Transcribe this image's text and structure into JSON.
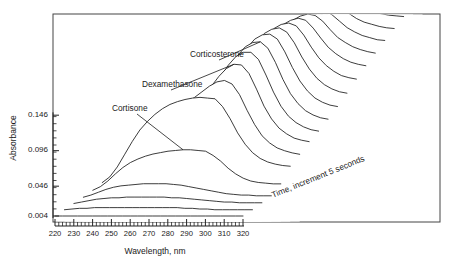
{
  "figure": {
    "frame": {
      "x": 53,
      "y": 14,
      "width": 387,
      "height": 208
    }
  },
  "axes": {
    "y_title": "Absorbance",
    "x_title": "Wavelength, nm",
    "y_ticks": [
      {
        "label": "0.004",
        "value": 0.004
      },
      {
        "label": "0.046",
        "value": 0.046
      },
      {
        "label": "0.096",
        "value": 0.096
      },
      {
        "label": "0.146",
        "value": 0.146
      }
    ],
    "x_ticks": [
      {
        "label": "220",
        "value": 220
      },
      {
        "label": "230",
        "value": 230
      },
      {
        "label": "240",
        "value": 240
      },
      {
        "label": "250",
        "value": 250
      },
      {
        "label": "260",
        "value": 260
      },
      {
        "label": "270",
        "value": 270
      },
      {
        "label": "280",
        "value": 280
      },
      {
        "label": "290",
        "value": 290
      },
      {
        "label": "300",
        "value": 300
      },
      {
        "label": "310",
        "value": 310
      },
      {
        "label": "320",
        "value": 320
      }
    ]
  },
  "annotations": {
    "cortisone": "Cortisone",
    "dexamethasone": "Dexamethasone",
    "corticosterone": "Corticosterone",
    "time_axis": "Time, increment 5 seconds"
  },
  "chart_data": {
    "type": "line",
    "title": "",
    "subtitle": "",
    "xlabel": "Wavelength, nm",
    "ylabel": "Absorbance",
    "zlabel": "Time, increment 5 seconds",
    "xlim": [
      220,
      320
    ],
    "ylim": [
      0.004,
      0.146
    ],
    "grid": false,
    "legend": "none",
    "plot_style": "3d-waterfall-stacked-spectra",
    "trace_count": 20,
    "time_increment_seconds": 5,
    "line_color": "#1a1a1a",
    "fill_color": "#ffffff",
    "x": [
      220,
      224,
      228,
      232,
      236,
      240,
      244,
      248,
      252,
      256,
      260,
      264,
      268,
      272,
      276,
      280,
      284,
      288,
      292,
      296,
      300,
      304,
      308,
      312,
      316,
      320
    ],
    "annotations": [
      {
        "text": "Cortisone",
        "peak_nm": 280,
        "trace_index": 4
      },
      {
        "text": "Dexamethasone",
        "peak_nm": 305,
        "trace_index": 7
      },
      {
        "text": "Corticosterone",
        "peak_nm": 313,
        "trace_index": 9
      }
    ],
    "series": [
      {
        "name": "t = 0 s",
        "time_s": 0,
        "values": [
          0.004,
          0.004,
          0.004,
          0.004,
          0.004,
          0.004,
          0.004,
          0.004,
          0.004,
          0.004,
          0.004,
          0.004,
          0.004,
          0.004,
          0.004,
          0.004,
          0.004,
          0.004,
          0.004,
          0.004,
          0.004,
          0.004,
          0.004,
          0.004,
          0.004,
          0.004
        ]
      },
      {
        "name": "t = 5 s",
        "time_s": 5,
        "values": [
          0.005,
          0.006,
          0.007,
          0.007,
          0.008,
          0.008,
          0.008,
          0.008,
          0.008,
          0.008,
          0.008,
          0.008,
          0.008,
          0.008,
          0.008,
          0.008,
          0.007,
          0.007,
          0.006,
          0.006,
          0.005,
          0.005,
          0.005,
          0.005,
          0.005,
          0.005
        ]
      },
      {
        "name": "t = 10 s",
        "time_s": 10,
        "values": [
          0.006,
          0.008,
          0.01,
          0.012,
          0.013,
          0.014,
          0.014,
          0.015,
          0.015,
          0.015,
          0.015,
          0.015,
          0.015,
          0.014,
          0.014,
          0.013,
          0.012,
          0.011,
          0.01,
          0.009,
          0.008,
          0.008,
          0.007,
          0.007,
          0.007,
          0.007
        ]
      },
      {
        "name": "t = 15 s",
        "time_s": 15,
        "values": [
          0.007,
          0.01,
          0.014,
          0.018,
          0.021,
          0.023,
          0.024,
          0.025,
          0.026,
          0.026,
          0.026,
          0.026,
          0.025,
          0.024,
          0.022,
          0.02,
          0.018,
          0.016,
          0.014,
          0.012,
          0.011,
          0.01,
          0.01,
          0.009,
          0.009,
          0.009
        ]
      },
      {
        "name": "t = 20 s",
        "time_s": 20,
        "values": [
          0.009,
          0.014,
          0.022,
          0.032,
          0.041,
          0.048,
          0.053,
          0.057,
          0.06,
          0.062,
          0.064,
          0.065,
          0.066,
          0.066,
          0.065,
          0.064,
          0.058,
          0.05,
          0.04,
          0.032,
          0.026,
          0.022,
          0.02,
          0.019,
          0.018,
          0.018
        ]
      },
      {
        "name": "t = 25 s",
        "time_s": 25,
        "values": [
          0.012,
          0.02,
          0.034,
          0.052,
          0.07,
          0.086,
          0.098,
          0.108,
          0.116,
          0.122,
          0.126,
          0.129,
          0.131,
          0.132,
          0.131,
          0.13,
          0.119,
          0.102,
          0.082,
          0.066,
          0.054,
          0.046,
          0.041,
          0.038,
          0.036,
          0.035
        ]
      },
      {
        "name": "t = 30 s",
        "time_s": 30,
        "values": [
          0.014,
          0.022,
          0.036,
          0.054,
          0.07,
          0.084,
          0.094,
          0.101,
          0.107,
          0.112,
          0.117,
          0.124,
          0.132,
          0.14,
          0.146,
          0.148,
          0.143,
          0.128,
          0.106,
          0.086,
          0.07,
          0.06,
          0.053,
          0.049,
          0.046,
          0.044
        ]
      },
      {
        "name": "t = 35 s",
        "time_s": 35,
        "values": [
          0.016,
          0.024,
          0.036,
          0.05,
          0.062,
          0.072,
          0.08,
          0.086,
          0.092,
          0.098,
          0.106,
          0.118,
          0.132,
          0.146,
          0.157,
          0.163,
          0.162,
          0.15,
          0.128,
          0.104,
          0.086,
          0.073,
          0.065,
          0.059,
          0.056,
          0.054
        ]
      },
      {
        "name": "t = 40 s",
        "time_s": 40,
        "values": [
          0.018,
          0.026,
          0.036,
          0.048,
          0.058,
          0.066,
          0.072,
          0.078,
          0.084,
          0.092,
          0.104,
          0.12,
          0.138,
          0.154,
          0.166,
          0.172,
          0.172,
          0.162,
          0.14,
          0.116,
          0.096,
          0.082,
          0.073,
          0.067,
          0.063,
          0.061
        ]
      },
      {
        "name": "t = 45 s",
        "time_s": 45,
        "values": [
          0.02,
          0.028,
          0.038,
          0.048,
          0.057,
          0.064,
          0.07,
          0.076,
          0.084,
          0.094,
          0.108,
          0.126,
          0.144,
          0.16,
          0.172,
          0.178,
          0.179,
          0.17,
          0.15,
          0.126,
          0.106,
          0.092,
          0.082,
          0.076,
          0.072,
          0.07
        ]
      },
      {
        "name": "t = 50 s",
        "time_s": 50,
        "values": [
          0.022,
          0.03,
          0.04,
          0.05,
          0.058,
          0.065,
          0.071,
          0.078,
          0.086,
          0.097,
          0.112,
          0.13,
          0.148,
          0.163,
          0.175,
          0.181,
          0.182,
          0.175,
          0.157,
          0.135,
          0.116,
          0.102,
          0.092,
          0.086,
          0.082,
          0.08
        ]
      },
      {
        "name": "t = 55 s",
        "time_s": 55,
        "values": [
          0.025,
          0.033,
          0.043,
          0.053,
          0.061,
          0.068,
          0.074,
          0.081,
          0.089,
          0.1,
          0.114,
          0.132,
          0.149,
          0.164,
          0.175,
          0.181,
          0.183,
          0.177,
          0.162,
          0.142,
          0.125,
          0.112,
          0.103,
          0.097,
          0.093,
          0.091
        ]
      },
      {
        "name": "t = 60 s",
        "time_s": 60,
        "values": [
          0.028,
          0.036,
          0.046,
          0.056,
          0.064,
          0.071,
          0.077,
          0.084,
          0.092,
          0.102,
          0.116,
          0.133,
          0.149,
          0.163,
          0.174,
          0.18,
          0.182,
          0.178,
          0.165,
          0.148,
          0.133,
          0.122,
          0.114,
          0.108,
          0.105,
          0.103
        ]
      },
      {
        "name": "t = 65 s",
        "time_s": 65,
        "values": [
          0.031,
          0.039,
          0.049,
          0.059,
          0.067,
          0.074,
          0.08,
          0.087,
          0.095,
          0.105,
          0.118,
          0.134,
          0.149,
          0.162,
          0.172,
          0.178,
          0.181,
          0.178,
          0.167,
          0.153,
          0.14,
          0.131,
          0.124,
          0.119,
          0.116,
          0.114
        ]
      },
      {
        "name": "t = 70 s",
        "time_s": 70,
        "values": [
          0.034,
          0.042,
          0.052,
          0.062,
          0.07,
          0.077,
          0.083,
          0.09,
          0.098,
          0.107,
          0.119,
          0.134,
          0.148,
          0.16,
          0.17,
          0.176,
          0.179,
          0.177,
          0.169,
          0.157,
          0.146,
          0.139,
          0.133,
          0.129,
          0.126,
          0.124
        ]
      },
      {
        "name": "t = 75 s",
        "time_s": 75,
        "values": [
          0.037,
          0.045,
          0.055,
          0.065,
          0.073,
          0.08,
          0.086,
          0.093,
          0.1,
          0.109,
          0.12,
          0.134,
          0.147,
          0.158,
          0.167,
          0.173,
          0.177,
          0.176,
          0.17,
          0.161,
          0.152,
          0.146,
          0.141,
          0.138,
          0.135,
          0.134
        ]
      },
      {
        "name": "t = 80 s",
        "time_s": 80,
        "values": [
          0.04,
          0.048,
          0.058,
          0.068,
          0.076,
          0.083,
          0.089,
          0.096,
          0.103,
          0.111,
          0.121,
          0.133,
          0.145,
          0.155,
          0.164,
          0.17,
          0.174,
          0.174,
          0.17,
          0.164,
          0.157,
          0.152,
          0.149,
          0.146,
          0.144,
          0.143
        ]
      },
      {
        "name": "t = 85 s",
        "time_s": 85,
        "values": [
          0.043,
          0.051,
          0.061,
          0.071,
          0.079,
          0.086,
          0.092,
          0.098,
          0.105,
          0.113,
          0.122,
          0.132,
          0.142,
          0.152,
          0.16,
          0.166,
          0.171,
          0.172,
          0.17,
          0.166,
          0.162,
          0.158,
          0.156,
          0.154,
          0.153,
          0.152
        ]
      },
      {
        "name": "t = 90 s",
        "time_s": 90,
        "values": [
          0.046,
          0.054,
          0.064,
          0.074,
          0.082,
          0.089,
          0.095,
          0.101,
          0.107,
          0.114,
          0.122,
          0.131,
          0.14,
          0.148,
          0.156,
          0.162,
          0.167,
          0.169,
          0.169,
          0.168,
          0.166,
          0.164,
          0.163,
          0.162,
          0.161,
          0.161
        ]
      },
      {
        "name": "t = 95 s",
        "time_s": 95,
        "values": [
          0.049,
          0.057,
          0.067,
          0.077,
          0.085,
          0.092,
          0.098,
          0.104,
          0.11,
          0.116,
          0.123,
          0.13,
          0.137,
          0.144,
          0.151,
          0.157,
          0.162,
          0.166,
          0.168,
          0.169,
          0.169,
          0.169,
          0.169,
          0.169,
          0.169,
          0.169
        ]
      }
    ]
  }
}
